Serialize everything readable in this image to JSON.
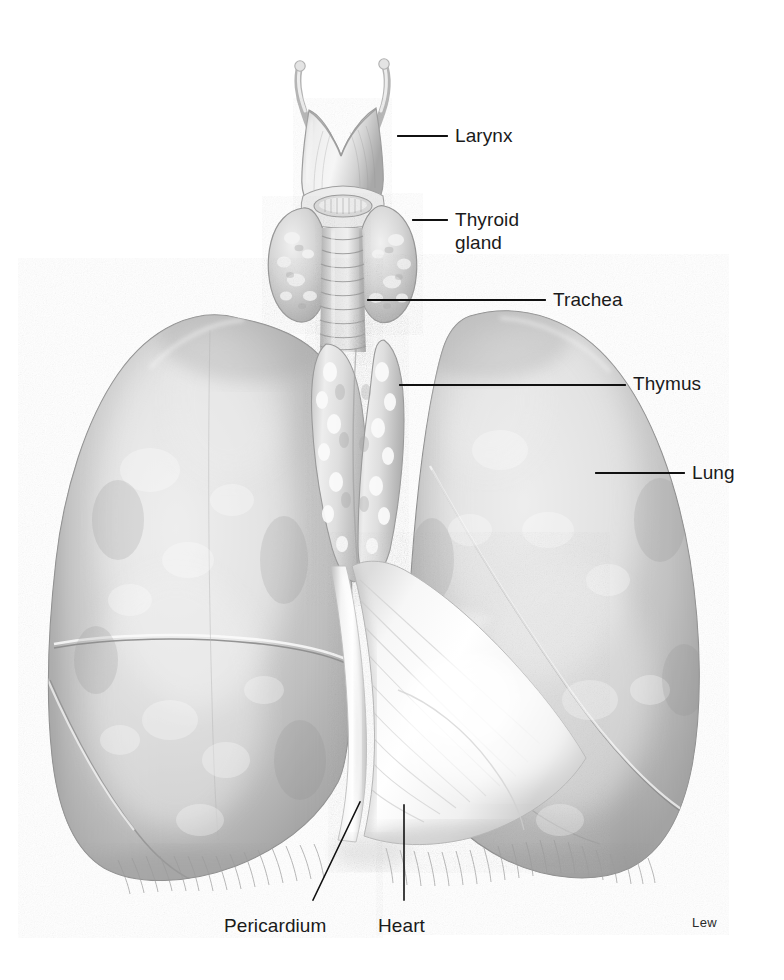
{
  "figure": {
    "width": 784,
    "height": 980,
    "background_color": "#ffffff",
    "signature": "Lew",
    "label_color": "#1a1a1a",
    "leader_color": "#111111"
  },
  "labels": [
    {
      "id": "larynx",
      "text": "Larynx",
      "text_x": 455,
      "text_y": 124,
      "leader": {
        "x1": 398,
        "y1": 136,
        "x2": 447,
        "y2": 136
      }
    },
    {
      "id": "thyroid",
      "text": "Thyroid",
      "text_x": 455,
      "text_y": 208,
      "leader": {
        "x1": 413,
        "y1": 220,
        "x2": 447,
        "y2": 220
      }
    },
    {
      "id": "thyroid2",
      "text": "gland",
      "text_x": 455,
      "text_y": 231,
      "leader": null
    },
    {
      "id": "trachea",
      "text": "Trachea",
      "text_x": 553,
      "text_y": 288,
      "leader": {
        "x1": 368,
        "y1": 300,
        "x2": 545,
        "y2": 300
      }
    },
    {
      "id": "thymus",
      "text": "Thymus",
      "text_x": 633,
      "text_y": 372,
      "leader": {
        "x1": 400,
        "y1": 385,
        "x2": 625,
        "y2": 385
      }
    },
    {
      "id": "lung",
      "text": "Lung",
      "text_x": 692,
      "text_y": 461,
      "leader": {
        "x1": 596,
        "y1": 473,
        "x2": 684,
        "y2": 473
      }
    },
    {
      "id": "pericardium",
      "text": "Pericardium",
      "text_x": 224,
      "text_y": 914,
      "leader": null
    },
    {
      "id": "heart",
      "text": "Heart",
      "text_x": 378,
      "text_y": 914,
      "leader": null
    }
  ],
  "angled_leaders": [
    {
      "id": "pericardium-leader",
      "x1": 360,
      "y1": 802,
      "x2": 313,
      "y2": 900
    },
    {
      "id": "heart-leader",
      "x1": 404,
      "y1": 805,
      "x2": 404,
      "y2": 900
    }
  ],
  "structures": [
    {
      "id": "larynx",
      "name": "Larynx (thyroid cartilage with superior horns)"
    },
    {
      "id": "thyroid-gland",
      "name": "Thyroid gland (two lobes and isthmus)"
    },
    {
      "id": "trachea",
      "name": "Trachea with cartilage rings"
    },
    {
      "id": "thymus",
      "name": "Thymus (bilobed, in superior mediastinum)"
    },
    {
      "id": "right-lung",
      "name": "Right lung (three lobes, horizontal and oblique fissures)"
    },
    {
      "id": "left-lung",
      "name": "Left lung (two lobes, cardiac notch)"
    },
    {
      "id": "pericardium",
      "name": "Pericardium (fibrous sac)"
    },
    {
      "id": "heart",
      "name": "Heart within pericardium"
    },
    {
      "id": "diaphragm",
      "name": "Diaphragm fringe at lung bases"
    }
  ],
  "palette": {
    "paper": "#ffffff",
    "tissue_light": "#f2f2f2",
    "tissue_mid": "#c9c9c9",
    "tissue_dark": "#9a9a9a",
    "tissue_shadow": "#7e7e7e",
    "outline": "#8a8a8a",
    "highlight": "#fbfbfb"
  }
}
